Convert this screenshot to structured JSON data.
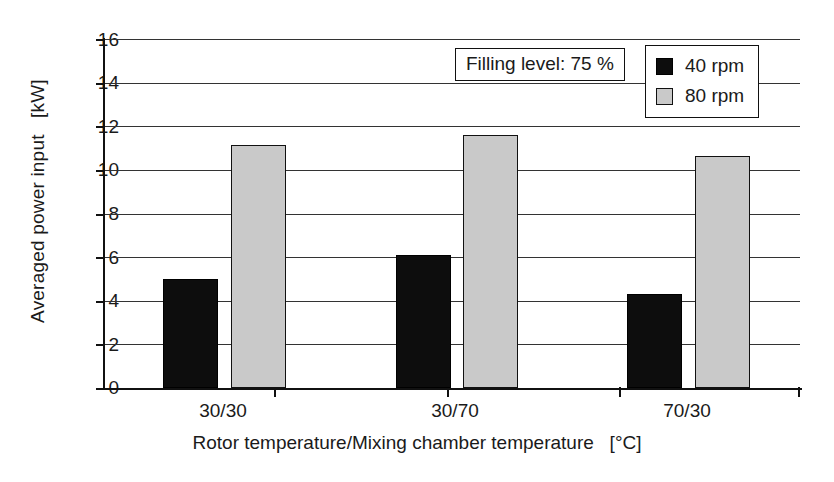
{
  "chart_data": {
    "type": "bar",
    "title": "",
    "xlabel": "Rotor temperature/Mixing chamber temperature   [°C]",
    "ylabel": "Averaged power input   [kW]",
    "categories": [
      "30/30",
      "30/70",
      "70/30"
    ],
    "series": [
      {
        "name": "40 rpm",
        "color": "#0d0d0d",
        "values": [
          5.0,
          6.1,
          4.3
        ]
      },
      {
        "name": "80 rpm",
        "color": "#c9c9c9",
        "values": [
          11.15,
          11.6,
          10.65
        ]
      }
    ],
    "ylim": [
      0,
      16
    ],
    "yticks": [
      0,
      2,
      4,
      6,
      8,
      10,
      12,
      14,
      16
    ],
    "ytick_labels": [
      "0",
      "2",
      "4",
      "6",
      "8",
      "10",
      "12",
      "14",
      "16"
    ],
    "grid": true,
    "legend_position": "top-right",
    "annotations": [
      {
        "name": "filling-level",
        "text": "Filling level: 75 %"
      }
    ]
  },
  "legend": {
    "entries": [
      {
        "label": "40 rpm"
      },
      {
        "label": "80 rpm"
      }
    ]
  },
  "annotation": {
    "filling_level": "Filling level: 75 %"
  },
  "axes": {
    "y_title": "Averaged power input   [kW]",
    "x_title": "Rotor temperature/Mixing chamber temperature   [°C]",
    "y_ticks": [
      "16",
      "14",
      "12",
      "10",
      "8",
      "6",
      "4",
      "2",
      "0"
    ],
    "x_ticks": [
      "30/30",
      "30/70",
      "70/30"
    ]
  }
}
